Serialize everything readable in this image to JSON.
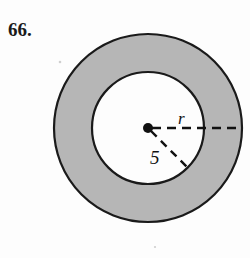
{
  "figure": {
    "problem_number": "66.",
    "type": "annulus-diagram",
    "labels": {
      "outer_radius": "r",
      "inner_radius": "5"
    },
    "colors": {
      "shaded_ring_fill": "#b6b6b6",
      "inner_circle_fill": "#fdfdfd",
      "stroke": "#1a1a1a",
      "page_background": "#fdfdfd",
      "text": "#111111"
    },
    "geometry": {
      "center_x": 148,
      "center_y": 128,
      "outer_radius_px": 94,
      "inner_radius_px": 56,
      "center_dot_radius_px": 5,
      "outer_dash_endpoint_x": 242,
      "inner_dash_endpoint_x": 190,
      "inner_dash_endpoint_y": 168
    }
  }
}
